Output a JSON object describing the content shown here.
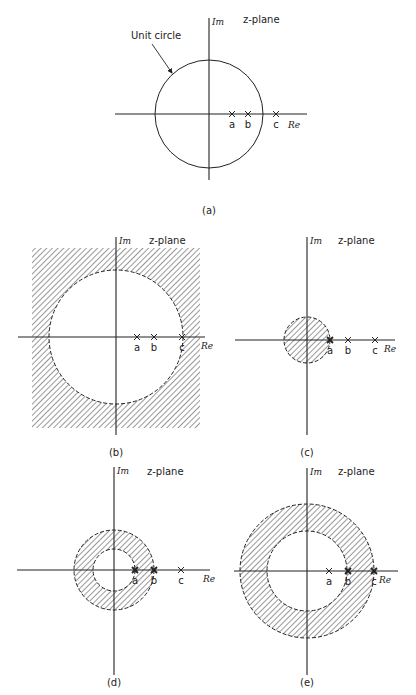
{
  "figure": {
    "annotation": {
      "text": "Unit circle",
      "x": 131,
      "y": 39,
      "arrow_from": [
        152,
        44
      ],
      "arrow_to": [
        172,
        73
      ]
    },
    "panels": [
      {
        "id": "a",
        "caption": "(a)",
        "plane_label": "z-plane",
        "im_label": "Im",
        "re_label": "Re",
        "origin": [
          209,
          114
        ],
        "v_axis": [
          18,
          180
        ],
        "h_axis": [
          115,
          307
        ],
        "caption_pos": [
          209,
          214
        ],
        "plane_label_pos": [
          243,
          23
        ],
        "re_label_pos": [
          288,
          128
        ],
        "region": {
          "type": "unit-circle",
          "r": 54,
          "style": "solid"
        },
        "poles": [
          {
            "label": "a",
            "x": 232,
            "marker": "x"
          },
          {
            "label": "b",
            "x": 248,
            "marker": "x"
          },
          {
            "label": "c",
            "x": 276,
            "marker": "x"
          }
        ]
      },
      {
        "id": "b",
        "caption": "(b)",
        "plane_label": "z-plane",
        "im_label": "Im",
        "re_label": "Re",
        "origin": [
          116,
          337
        ],
        "v_axis": [
          237,
          435
        ],
        "h_axis": [
          18,
          205
        ],
        "caption_pos": [
          116,
          456
        ],
        "plane_label_pos": [
          149,
          244
        ],
        "re_label_pos": [
          201,
          349
        ],
        "region": {
          "type": "exterior",
          "r": 67,
          "box": [
            32,
            248,
            200,
            428
          ],
          "style": "dashed"
        },
        "poles": [
          {
            "label": "a",
            "x": 137,
            "marker": "x"
          },
          {
            "label": "b",
            "x": 154,
            "marker": "x"
          },
          {
            "label": "c",
            "x": 182,
            "marker": "x"
          }
        ]
      },
      {
        "id": "c",
        "caption": "(c)",
        "plane_label": "z-plane",
        "im_label": "Im",
        "re_label": "Re",
        "origin": [
          307,
          340
        ],
        "v_axis": [
          237,
          435
        ],
        "h_axis": [
          235,
          395
        ],
        "caption_pos": [
          307,
          456
        ],
        "plane_label_pos": [
          338,
          244
        ],
        "re_label_pos": [
          384,
          352
        ],
        "region": {
          "type": "disk",
          "r": 23,
          "style": "dashed"
        },
        "poles": [
          {
            "label": "a",
            "x": 330,
            "marker": "x-bold"
          },
          {
            "label": "b",
            "x": 348,
            "marker": "x"
          },
          {
            "label": "c",
            "x": 375,
            "marker": "x"
          }
        ]
      },
      {
        "id": "d",
        "caption": "(d)",
        "plane_label": "z-plane",
        "im_label": "Im",
        "re_label": "Re",
        "origin": [
          114,
          570
        ],
        "v_axis": [
          467,
          675
        ],
        "h_axis": [
          17,
          210
        ],
        "caption_pos": [
          114,
          686
        ],
        "plane_label_pos": [
          147,
          475
        ],
        "re_label_pos": [
          203,
          582
        ],
        "region": {
          "type": "annulus",
          "r_inner": 21,
          "r_outer": 40,
          "style": "dashed"
        },
        "poles": [
          {
            "label": "a",
            "x": 135,
            "marker": "x-bold"
          },
          {
            "label": "b",
            "x": 154,
            "marker": "x-bold"
          },
          {
            "label": "c",
            "x": 181,
            "marker": "x"
          }
        ]
      },
      {
        "id": "e",
        "caption": "(e)",
        "plane_label": "z-plane",
        "im_label": "Im",
        "re_label": "Re",
        "origin": [
          307,
          571
        ],
        "v_axis": [
          468,
          675
        ],
        "h_axis": [
          234,
          398
        ],
        "caption_pos": [
          307,
          686
        ],
        "plane_label_pos": [
          338,
          475
        ],
        "re_label_pos": [
          379,
          583
        ],
        "region": {
          "type": "annulus",
          "r_inner": 40,
          "r_outer": 67,
          "style": "dashed"
        },
        "poles": [
          {
            "label": "a",
            "x": 329,
            "marker": "x"
          },
          {
            "label": "b",
            "x": 348,
            "marker": "x-bold"
          },
          {
            "label": "c",
            "x": 374,
            "marker": "x-bold"
          }
        ]
      }
    ],
    "colors": {
      "ink": "#222222",
      "hatch": "#333333",
      "background": "#ffffff"
    }
  }
}
